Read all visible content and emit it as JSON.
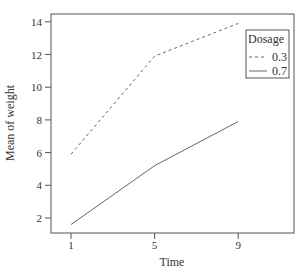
{
  "chart_data": {
    "type": "line",
    "title": "",
    "xlabel": "Time",
    "ylabel": "Mean of  weight",
    "x": [
      1,
      5,
      9
    ],
    "x_ticks": [
      "1",
      "5",
      "9"
    ],
    "y_ticks": [
      "2",
      "4",
      "6",
      "8",
      "10",
      "12",
      "14"
    ],
    "ylim": [
      1.2,
      14.4
    ],
    "grid": false,
    "legend": {
      "title": "Dosage",
      "position": "top-right-inside",
      "entries": [
        {
          "label": "0.3",
          "style": "dashed"
        },
        {
          "label": "0.7",
          "style": "solid"
        }
      ]
    },
    "series": [
      {
        "name": "0.3",
        "style": "dashed",
        "values": [
          5.9,
          11.9,
          13.9
        ]
      },
      {
        "name": "0.7",
        "style": "solid",
        "values": [
          1.6,
          5.2,
          7.9
        ]
      }
    ]
  }
}
